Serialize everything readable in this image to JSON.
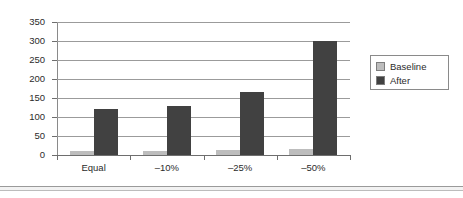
{
  "chart_data": {
    "type": "bar",
    "title": "",
    "subtitle": "",
    "xlabel": "",
    "ylabel": "",
    "categories": [
      "Equal",
      "–10%",
      "–25%",
      "–50%"
    ],
    "series": [
      {
        "name": "Baseline",
        "color": "#bdbdbd",
        "values": [
          10,
          10,
          12,
          16
        ]
      },
      {
        "name": "After",
        "color": "#414141",
        "values": [
          120,
          130,
          165,
          300
        ]
      }
    ],
    "ylim": [
      0,
      350
    ],
    "ytick_values": [
      0,
      50,
      100,
      150,
      200,
      250,
      300,
      350
    ],
    "ytick_labels": [
      "0",
      "50",
      "100",
      "150",
      "200",
      "250",
      "300",
      "350"
    ],
    "grid": "horizontal",
    "legend_position": "right",
    "legend_entries": [
      "Baseline",
      "After"
    ]
  },
  "figure": {
    "background_color": "#ffffff",
    "gridline_color": "#9b9b9b",
    "axis_color": "#6e6e6e",
    "text_color": "#2b2b2b"
  }
}
